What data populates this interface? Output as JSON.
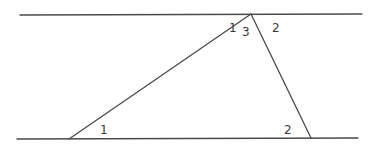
{
  "diagram": {
    "colors": {
      "line": "#4a4a4a",
      "label": "#3a3a3a",
      "background": "#ffffff"
    },
    "lines": {
      "top_parallel": {
        "x1": 20,
        "y1": 15,
        "x2": 362,
        "y2": 14
      },
      "bottom_parallel": {
        "x1": 17,
        "y1": 139,
        "x2": 358,
        "y2": 138
      },
      "triangle_left_side": {
        "x1": 69,
        "y1": 139,
        "x2": 251,
        "y2": 14
      },
      "triangle_right_side": {
        "x1": 251,
        "y1": 14,
        "x2": 311,
        "y2": 138
      }
    },
    "labels": [
      {
        "id": "top-angle-1",
        "text": "1",
        "x": 229,
        "y": 32
      },
      {
        "id": "top-angle-3",
        "text": "3",
        "x": 242,
        "y": 36
      },
      {
        "id": "top-angle-2",
        "text": "2",
        "x": 272,
        "y": 32
      },
      {
        "id": "bottom-left-angle-1",
        "text": "1",
        "x": 100,
        "y": 134
      },
      {
        "id": "bottom-right-angle-2",
        "text": "2",
        "x": 284,
        "y": 134
      }
    ]
  }
}
